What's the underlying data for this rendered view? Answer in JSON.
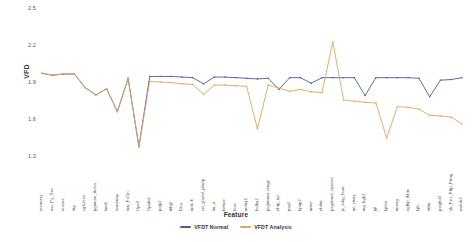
{
  "chart_data": {
    "type": "line",
    "title": "",
    "xlabel": "Feature",
    "ylabel": "VFD",
    "ylim": [
      1.3,
      2.5
    ],
    "yticks": [
      "1.3",
      "1.6",
      "1.9",
      "2.2",
      "2.5"
    ],
    "grid": false,
    "legend_position": "bottom-center",
    "categories": [
      "recovery",
      "asr_Py_Sec",
      "rescue",
      "dtp",
      "sg6-less",
      "pgiauan_ttclus",
      "lom1",
      "roadmap",
      "low_PcOn",
      "Ope2",
      "Opqbi2",
      "pqtp2",
      "ttlbj2",
      "Dizy",
      "mrlu-h",
      "crt_glsesf_pfadp",
      "lm_d",
      "kefure",
      "hcin",
      "mrlinj2",
      "hqlbq2",
      "pcgtamm_dmgp",
      "nhtp_tyc",
      "psp2",
      "hpop2",
      "mtne",
      "nhtlm",
      "psgutmer_tqsend",
      "jx_lubg_hum",
      "ml_clisty",
      "mp_kgh2",
      "pjl",
      "kjrlen",
      "tmeog",
      "ngfhjl_lhhtn",
      "hjlu",
      "dtfm",
      "pstgbd2",
      "sb_Pnz_Ptfp_Ptmg",
      "wetub2"
    ],
    "series": [
      {
        "name": "VFDT Normal",
        "color": "#4a5d96",
        "values": [
          1.97,
          1.955,
          1.965,
          1.965,
          1.855,
          1.795,
          1.845,
          1.66,
          1.93,
          1.375,
          1.945,
          1.945,
          1.945,
          1.94,
          1.935,
          1.885,
          1.94,
          1.94,
          1.935,
          1.93,
          1.925,
          1.93,
          1.84,
          1.935,
          1.935,
          1.89,
          1.935,
          1.935,
          1.935,
          1.935,
          1.79,
          1.935,
          1.935,
          1.935,
          1.935,
          1.93,
          1.78,
          1.915,
          1.92,
          1.935
        ]
      },
      {
        "name": "VFDT Analysis",
        "color": "#e3a45a",
        "values": [
          1.97,
          1.955,
          1.965,
          1.965,
          1.855,
          1.795,
          1.845,
          1.66,
          1.93,
          1.375,
          1.905,
          1.9,
          1.895,
          1.885,
          1.88,
          1.8,
          1.875,
          1.875,
          1.87,
          1.865,
          1.52,
          1.875,
          1.85,
          1.825,
          1.84,
          1.82,
          1.815,
          2.225,
          1.755,
          1.745,
          1.735,
          1.73,
          1.445,
          1.7,
          1.695,
          1.68,
          1.63,
          1.625,
          1.615,
          1.56
        ]
      }
    ]
  },
  "legend": {
    "items": [
      {
        "label": "VFDT Normal",
        "color": "#4a5d96"
      },
      {
        "label": "VFDT Analysis",
        "color": "#e3a45a"
      }
    ]
  },
  "axes": {
    "y_title": "VFD",
    "x_title": "Feature"
  }
}
